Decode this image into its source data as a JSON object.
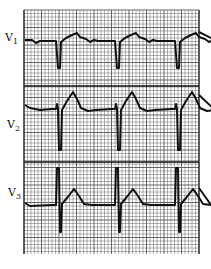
{
  "figure": {
    "type": "electrocardiogram strip",
    "leads": [
      {
        "name": "V",
        "sub": "1",
        "label": "V1",
        "beats": 3,
        "qrs": "deep negative QS",
        "t_wave": "small upright"
      },
      {
        "name": "V",
        "sub": "2",
        "label": "V2",
        "beats": 3,
        "qrs": "small r, deep S",
        "t_wave": "tall upright"
      },
      {
        "name": "V",
        "sub": "3",
        "label": "V3",
        "beats": 3,
        "qrs": "tall R, deep S",
        "t_wave": "upright"
      }
    ]
  },
  "colors": {
    "grid": "#555555",
    "trace": "#111111",
    "background": "#ffffff"
  }
}
